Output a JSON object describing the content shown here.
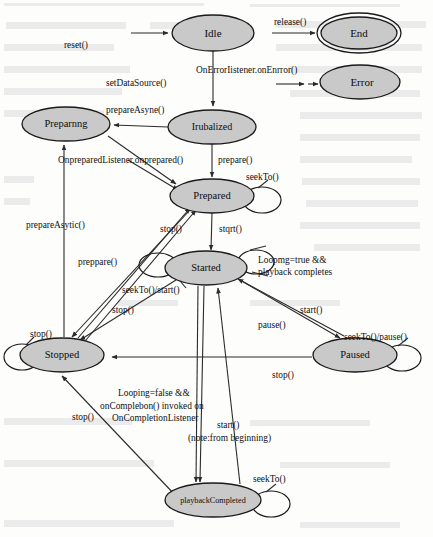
{
  "diagram": {
    "type": "state-machine",
    "colors": {
      "state_fill": "#c9c9c9",
      "state_stroke": "#1a1a1a",
      "edge_stroke": "#2b2b2b",
      "background": "#fdfdfc",
      "text": "#0d0d0d"
    },
    "states": [
      {
        "id": "idle",
        "label": "Idle",
        "cx": 213,
        "cy": 33,
        "rx": 41,
        "ry": 18,
        "final": false,
        "font_size": 11
      },
      {
        "id": "end",
        "label": "End",
        "cx": 359,
        "cy": 33,
        "rx": 38,
        "ry": 16,
        "final": true,
        "font_size": 11
      },
      {
        "id": "error",
        "label": "Error",
        "cx": 360,
        "cy": 82,
        "rx": 40,
        "ry": 17,
        "final": false,
        "font_size": 11
      },
      {
        "id": "initialized",
        "label": "Irubalized",
        "cx": 212,
        "cy": 127,
        "rx": 44,
        "ry": 17,
        "final": false,
        "font_size": 10
      },
      {
        "id": "preparing",
        "label": "Preparnng",
        "cx": 66,
        "cy": 124,
        "rx": 44,
        "ry": 17,
        "final": false,
        "font_size": 10.5
      },
      {
        "id": "prepared",
        "label": "Prepared",
        "cx": 212,
        "cy": 196,
        "rx": 42,
        "ry": 17,
        "final": false,
        "font_size": 10.5
      },
      {
        "id": "started",
        "label": "Started",
        "cx": 206,
        "cy": 268,
        "rx": 41,
        "ry": 17,
        "final": false,
        "font_size": 10.5
      },
      {
        "id": "stopped",
        "label": "Stopped",
        "cx": 62,
        "cy": 355,
        "rx": 42,
        "ry": 17,
        "final": false,
        "font_size": 10.5
      },
      {
        "id": "paused",
        "label": "Paused",
        "cx": 355,
        "cy": 355,
        "rx": 42,
        "ry": 17,
        "final": false,
        "font_size": 10.5
      },
      {
        "id": "playback_completed",
        "label": "playbackCompleted",
        "cx": 213,
        "cy": 500,
        "rx": 48,
        "ry": 17,
        "final": false,
        "font_size": 8.2
      }
    ],
    "transitions": [
      {
        "id": "t-reset",
        "label": "reset()",
        "from": "external",
        "to": "idle"
      },
      {
        "id": "t-release",
        "label": "release()",
        "from": "external",
        "to": "end"
      },
      {
        "id": "t-onerror",
        "label": "OnErrorIistener.onEnrror()",
        "from": "external",
        "to": "error"
      },
      {
        "id": "t-setdatasource",
        "label": "setDataSource()",
        "from": "idle",
        "to": "initialized"
      },
      {
        "id": "t-prepareasync",
        "label": "prepareAsyne()",
        "from": "initialized",
        "to": "preparing"
      },
      {
        "id": "t-onprepared",
        "label": "OnpreparedListener.onprepared()",
        "from": "preparing",
        "to": "prepared"
      },
      {
        "id": "t-prepare",
        "label": "prepare()",
        "from": "initialized",
        "to": "prepared"
      },
      {
        "id": "t-seekto-prepared",
        "label": "seekTo()",
        "from": "prepared",
        "to": "prepared"
      },
      {
        "id": "t-start",
        "label": "stqrt()",
        "from": "prepared",
        "to": "started"
      },
      {
        "id": "t-stop-prepared",
        "label": "stop()",
        "from": "prepared",
        "to": "stopped"
      },
      {
        "id": "t-loop-true",
        "label": "Loopmg=true &&\nplayback completes",
        "from": "started",
        "to": "started"
      },
      {
        "id": "t-seekto-start",
        "label": "seekTo()/start()",
        "from": "started",
        "to": "started"
      },
      {
        "id": "t-stop-started",
        "label": "stop()",
        "from": "started",
        "to": "stopped"
      },
      {
        "id": "t-pause",
        "label": "pause()",
        "from": "started",
        "to": "paused"
      },
      {
        "id": "t-start-paused",
        "label": "start()",
        "from": "paused",
        "to": "started"
      },
      {
        "id": "t-seekto-pause",
        "label": "seekTo()/pause()",
        "from": "paused",
        "to": "paused"
      },
      {
        "id": "t-stop-paused",
        "label": "stop()",
        "from": "paused",
        "to": "stopped"
      },
      {
        "id": "t-prepareasytic",
        "label": "prepareAsytic()",
        "from": "stopped",
        "to": "preparing"
      },
      {
        "id": "t-preppare",
        "label": "preppare()",
        "from": "stopped",
        "to": "prepared"
      },
      {
        "id": "t-stop-left",
        "label": "stop()",
        "from": "stopped",
        "to": "stopped"
      },
      {
        "id": "t-oncompletion",
        "label": "Looping=false &&\nonComplebon()  invoked on\nOnCompletionListener",
        "from": "started",
        "to": "playback_completed"
      },
      {
        "id": "t-start-from-begin",
        "label": "start()\n(note:from beginning)",
        "from": "playback_completed",
        "to": "started"
      },
      {
        "id": "t-stop-playback",
        "label": "stop()",
        "from": "playback_completed",
        "to": "stopped"
      },
      {
        "id": "t-seekto-playback",
        "label": "seekTo()",
        "from": "playback_completed",
        "to": "playback_completed"
      }
    ],
    "edge_labels": {
      "reset": "reset()",
      "release": "release()",
      "on_error": "OnErrorIistener.onEnrror()",
      "set_data_source": "setDataSource()",
      "prepare_async": "prepareAsyne()",
      "on_prepared": "OnpreparedListener.onprepared()",
      "prepare": "prepare()",
      "seek_to_prepared": "seekTo()",
      "start_from_prepared": "stqrt()",
      "stop_from_prepared": "stop()",
      "loop_line1": "Loopmg=true &&",
      "loop_line2": "playback completes",
      "seek_to_start": "seekTo()/start()",
      "stop_from_started": "stop()",
      "pause": "pause()",
      "start_from_paused": "start()",
      "seek_to_pause": "seekTo()/pause()",
      "stop_from_paused": "stop()",
      "prepare_asytic": "prepareAsytic()",
      "preppare": "preppare()",
      "stop_self_left": "stop()",
      "completion_line1": "Looping=false &&",
      "completion_line2": "onComplebon()  invoked on",
      "completion_line3": "OnCompletionListener",
      "start_note_line1": "start()",
      "start_note_line2": "(note:from beginning)",
      "stop_from_playback": "stop()",
      "seek_to_playback": "seekTo()"
    }
  }
}
